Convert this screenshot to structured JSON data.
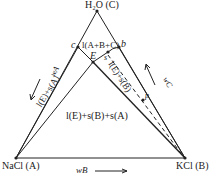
{
  "vertices": {
    "top": "H₂O (C)",
    "left": "NaCl (A)",
    "right": "KCl (B)"
  },
  "points": {
    "c": "c",
    "b": "b",
    "E": "E",
    "s": "s",
    "p": "p"
  },
  "regions": {
    "top": "l(A+B+C)",
    "left_strip": "l(E)+s(A)",
    "right_strip": "l(E)+s(B)",
    "center": "l(E)+s(B)+s(A)"
  },
  "axes": {
    "left": "wₐ",
    "right": "wᶜ",
    "bottom": "wʙ"
  },
  "axis_labels": {
    "left": "wA",
    "right": "wC",
    "bottom": "wB"
  },
  "colors": {
    "line": "#222222",
    "background": "#ffffff"
  }
}
